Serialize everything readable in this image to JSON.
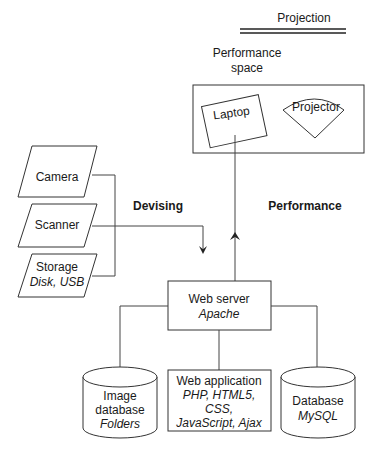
{
  "title": "Projection",
  "performance_space": {
    "line1": "Performance",
    "line2": "space"
  },
  "laptop": "Laptop",
  "projector": "Projector",
  "inputs": [
    {
      "label": "Camera"
    },
    {
      "label": "Scanner"
    },
    {
      "label": "Storage",
      "sub": "Disk, USB"
    }
  ],
  "flows": {
    "devising": "Devising",
    "performance": "Performance"
  },
  "web_server": {
    "label": "Web server",
    "sub": "Apache"
  },
  "image_db": {
    "line1": "Image",
    "line2": "database",
    "sub": "Folders"
  },
  "web_app": {
    "label": "Web application",
    "sub1": "PHP, HTML5,",
    "sub2": "CSS,",
    "sub3": "JavaScript, Ajax"
  },
  "database": {
    "label": "Database",
    "sub": "MySQL"
  }
}
